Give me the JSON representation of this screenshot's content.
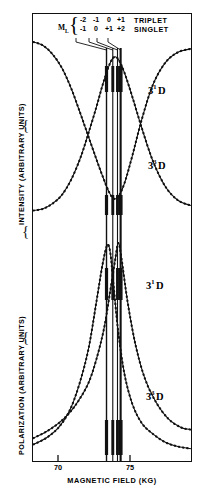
{
  "figure": {
    "axes": {
      "y_upper_label": "INTENSITY (ARBITRARY UNITS)",
      "y_lower_label": "POLARIZATION (ARBITRARY UNITS)",
      "x_label": "MAGNETIC FIELD (KG)",
      "x_ticks": [
        "70",
        "75"
      ]
    },
    "legend": {
      "ml_symbol": "M",
      "ml_subscript": "L",
      "triplet_values": [
        "-2",
        "-1",
        "0",
        "+1"
      ],
      "singlet_values": [
        "-1",
        "0",
        "+1",
        "+2"
      ],
      "triplet_label": "TRIPLET",
      "singlet_label": "SINGLET"
    },
    "curve_labels": [
      {
        "n": "3",
        "mult": "1",
        "term": "D"
      },
      {
        "n": "3",
        "mult": "3",
        "term": "D"
      },
      {
        "n": "3",
        "mult": "1",
        "term": "D"
      },
      {
        "n": "3",
        "mult": "3",
        "term": "D"
      }
    ]
  },
  "chart_data": {
    "type": "line",
    "title": "",
    "xlabel": "MAGNETIC FIELD (KG)",
    "ylabel": "INTENSITY (ARBITRARY UNITS) / POLARIZATION (ARBITRARY UNITS)",
    "xlim": [
      67.3,
      77.5
    ],
    "grid": false,
    "legend_position": "top-right",
    "annotations": [
      {
        "text": "TRIPLET",
        "role": "manifold-label"
      },
      {
        "text": "SINGLET",
        "role": "manifold-label"
      },
      {
        "text": "M_L = -2,-1,0,+1 (triplet)",
        "role": "level-markers"
      },
      {
        "text": "M_L = -1,0,+1,+2 (singlet)",
        "role": "level-markers"
      }
    ],
    "level_crossing_markers_kg": [
      72.05,
      72.45,
      72.75,
      72.95
    ],
    "panels": [
      {
        "panel": "intensity",
        "ylabel": "INTENSITY (ARBITRARY UNITS)",
        "series": [
          {
            "name": "3 1 D intensity",
            "label": "3¹D",
            "type": "line",
            "x": [
              67.4,
              68.0,
              68.6,
              69.2,
              69.8,
              70.4,
              70.9,
              71.4,
              71.8,
              72.2,
              72.5,
              72.8,
              73.2,
              73.7,
              74.3,
              75.0,
              75.8,
              76.6,
              77.4
            ],
            "y": [
              1.0,
              0.98,
              0.93,
              0.85,
              0.73,
              0.58,
              0.45,
              0.32,
              0.22,
              0.13,
              0.09,
              0.1,
              0.18,
              0.34,
              0.55,
              0.75,
              0.88,
              0.94,
              0.96
            ]
          },
          {
            "name": "3 3 D intensity",
            "label": "3³D",
            "type": "line",
            "x": [
              67.4,
              68.0,
              68.6,
              69.2,
              69.8,
              70.4,
              70.9,
              71.4,
              71.8,
              72.2,
              72.5,
              72.8,
              73.2,
              73.7,
              74.3,
              75.0,
              75.8,
              76.6,
              77.4
            ],
            "y": [
              0.02,
              0.03,
              0.06,
              0.11,
              0.2,
              0.33,
              0.47,
              0.62,
              0.75,
              0.86,
              0.91,
              0.9,
              0.82,
              0.68,
              0.5,
              0.31,
              0.16,
              0.08,
              0.05
            ]
          }
        ]
      },
      {
        "panel": "polarization",
        "ylabel": "POLARIZATION (ARBITRARY UNITS)",
        "series": [
          {
            "name": "3 1 D polarization",
            "label": "3¹D",
            "type": "line",
            "x": [
              67.4,
              68.2,
              69.0,
              69.7,
              70.3,
              70.9,
              71.4,
              71.9,
              72.3,
              72.6,
              72.8,
              73.0,
              73.4,
              73.9,
              74.5,
              75.2,
              76.0,
              76.8,
              77.4
            ],
            "y": [
              0.08,
              0.11,
              0.15,
              0.2,
              0.26,
              0.34,
              0.45,
              0.6,
              0.78,
              0.92,
              1.0,
              0.93,
              0.72,
              0.52,
              0.36,
              0.25,
              0.17,
              0.13,
              0.12
            ]
          },
          {
            "name": "3 3 D polarization",
            "label": "3³D",
            "type": "line",
            "x": [
              67.4,
              68.2,
              69.0,
              69.7,
              70.3,
              70.9,
              71.4,
              71.8,
              72.1,
              72.3,
              72.5,
              72.8,
              73.2,
              73.7,
              74.3,
              75.0,
              75.8,
              76.6,
              77.4
            ],
            "y": [
              0.05,
              0.08,
              0.13,
              0.21,
              0.33,
              0.5,
              0.72,
              0.9,
              0.99,
              0.95,
              0.8,
              0.58,
              0.38,
              0.24,
              0.15,
              0.1,
              0.06,
              0.04,
              0.03
            ]
          }
        ]
      }
    ]
  }
}
